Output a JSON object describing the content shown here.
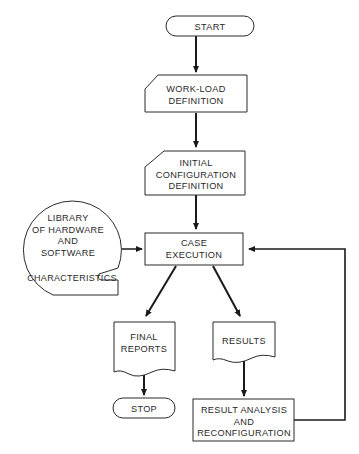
{
  "diagram": {
    "type": "flowchart",
    "nodes": {
      "start": {
        "shape": "terminator",
        "lines": [
          "START"
        ]
      },
      "workload": {
        "shape": "manual-input",
        "lines": [
          "WORK-LOAD",
          "DEFINITION"
        ]
      },
      "initial_config": {
        "shape": "manual-input",
        "lines": [
          "INITIAL",
          "CONFIGURATION",
          "DEFINITION"
        ]
      },
      "case_execution": {
        "shape": "process",
        "lines": [
          "CASE",
          "EXECUTION"
        ]
      },
      "library": {
        "shape": "stored-data",
        "lines": [
          "LIBRARY",
          "OF HARDWARE",
          "AND",
          "SOFTWARE",
          "CHARACTERISTICS"
        ]
      },
      "final_reports": {
        "shape": "document",
        "lines": [
          "FINAL",
          "REPORTS"
        ]
      },
      "results": {
        "shape": "document",
        "lines": [
          "RESULTS"
        ]
      },
      "stop": {
        "shape": "terminator",
        "lines": [
          "STOP"
        ]
      },
      "result_analysis": {
        "shape": "process",
        "lines": [
          "RESULT ANALYSIS",
          "AND",
          "RECONFIGURATION"
        ]
      }
    },
    "edges": [
      {
        "from": "START",
        "to": "WORK-LOAD DEFINITION"
      },
      {
        "from": "WORK-LOAD DEFINITION",
        "to": "INITIAL CONFIGURATION DEFINITION"
      },
      {
        "from": "INITIAL CONFIGURATION DEFINITION",
        "to": "CASE EXECUTION"
      },
      {
        "from": "LIBRARY OF HARDWARE AND SOFTWARE CHARACTERISTICS",
        "to": "CASE EXECUTION"
      },
      {
        "from": "CASE EXECUTION",
        "to": "FINAL REPORTS"
      },
      {
        "from": "CASE EXECUTION",
        "to": "RESULTS"
      },
      {
        "from": "FINAL REPORTS",
        "to": "STOP"
      },
      {
        "from": "RESULTS",
        "to": "RESULT ANALYSIS AND RECONFIGURATION"
      },
      {
        "from": "RESULT ANALYSIS AND RECONFIGURATION",
        "to": "CASE EXECUTION"
      }
    ]
  }
}
